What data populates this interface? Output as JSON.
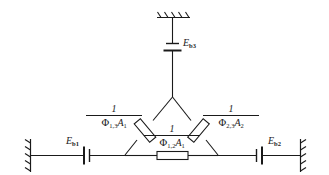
{
  "figure": {
    "type": "magnetic-circuit-schematic",
    "line_color": "#1a1a1a",
    "background_color": "#ffffff"
  },
  "sources": [
    {
      "id": "eb1",
      "symbol": "E",
      "subscript": "b1",
      "position": "left-branch",
      "element": "battery-cell"
    },
    {
      "id": "eb2",
      "symbol": "E",
      "subscript": "b2",
      "position": "right-branch",
      "element": "battery-cell"
    },
    {
      "id": "eb3",
      "symbol": "E",
      "subscript": "b3",
      "position": "top-branch",
      "element": "battery-cell"
    }
  ],
  "reluctances": [
    {
      "id": "r13",
      "numerator": "1",
      "denominator_phi": "Φ",
      "denominator_phi_sub": "1,3",
      "denominator_area": "A",
      "denominator_area_sub": "1",
      "position": "upper-left-leg"
    },
    {
      "id": "r23",
      "numerator": "1",
      "denominator_phi": "Φ",
      "denominator_phi_sub": "2,3",
      "denominator_area": "A",
      "denominator_area_sub": "2",
      "position": "upper-right-leg"
    },
    {
      "id": "r12",
      "numerator": "1",
      "denominator_phi": "Φ",
      "denominator_phi_sub": "1,2",
      "denominator_area": "A",
      "denominator_area_sub": "1",
      "position": "bottom-leg"
    }
  ],
  "grounds": [
    {
      "id": "ground-top",
      "orientation": "horizontal",
      "position": "top"
    },
    {
      "id": "ground-left",
      "orientation": "vertical",
      "position": "left"
    },
    {
      "id": "ground-right",
      "orientation": "vertical",
      "position": "right"
    }
  ]
}
